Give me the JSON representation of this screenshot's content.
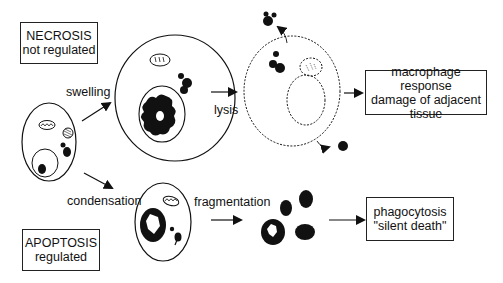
{
  "necrosis_box": {
    "title": "NECROSIS",
    "subtitle": "not regulated"
  },
  "apoptosis_box": {
    "title": "APOPTOSIS",
    "subtitle": "regulated"
  },
  "labels": {
    "swelling": "swelling",
    "lysis": "lysis",
    "condensation": "condensation",
    "fragmentation": "fragmentation"
  },
  "outcome_necrosis": {
    "line1": "macrophage response",
    "line2": "damage of adjacent",
    "line3": "tissue"
  },
  "outcome_apoptosis": {
    "line1": "phagocytosis",
    "line2": "\"silent death\""
  },
  "stages": [
    "normal cell",
    "swollen cell",
    "lysed cell",
    "condensed cell",
    "apoptotic bodies"
  ],
  "colors": {
    "line": "#111111",
    "background": "#ffffff"
  }
}
